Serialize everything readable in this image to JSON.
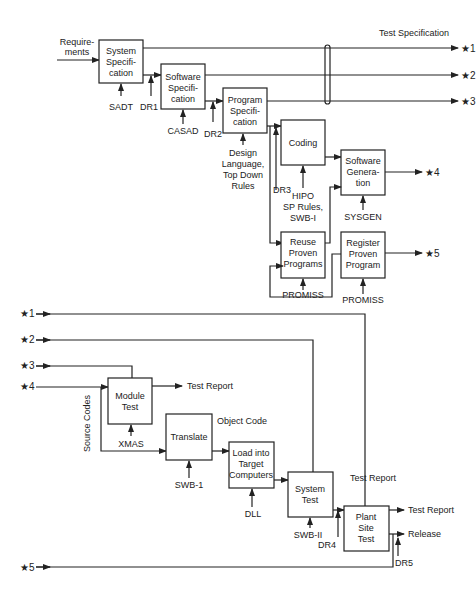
{
  "diagram": {
    "top_label": "Test Specification",
    "input_label": [
      "Require-",
      "ments"
    ],
    "boxes": {
      "system_spec": [
        "System",
        "Specifi-",
        "cation"
      ],
      "software_spec": [
        "Software",
        "Specifi-",
        "cation"
      ],
      "program_spec": [
        "Program",
        "Specifi-",
        "cation"
      ],
      "coding": [
        "Coding"
      ],
      "software_generation": [
        "Software",
        "Genera-",
        "tion"
      ],
      "reuse_proven": [
        "Reuse",
        "Proven",
        "Programs"
      ],
      "register_proven": [
        "Register",
        "Proven",
        "Program"
      ],
      "module_test": [
        "Module",
        "Test"
      ],
      "translate": [
        "Translate"
      ],
      "load_target": [
        "Load into",
        "Target",
        "Computers"
      ],
      "system_test": [
        "System",
        "Test"
      ],
      "plant_site_test": [
        "Plant",
        "Site",
        "Test"
      ]
    },
    "tools": {
      "sadt": "SADT",
      "casad": "CASAD",
      "design_lang": [
        "Design",
        "Language,",
        "Top Down",
        "Rules"
      ],
      "hipo": [
        "HIPO",
        "SP Rules,",
        "SWB-I"
      ],
      "sysgen": "SYSGEN",
      "promiss_reuse": "PROMISS",
      "promiss_register": "PROMISS",
      "xmas": "XMAS",
      "swb1": "SWB-1",
      "dll": "DLL",
      "swb2": "SWB-II"
    },
    "reviews": {
      "dr1": "DR1",
      "dr2": "DR2",
      "dr3": "DR3",
      "dr4": "DR4",
      "dr5": "DR5"
    },
    "connectors": {
      "c1": "★1",
      "c2": "★2",
      "c3": "★3",
      "c4": "★4",
      "c5": "★5"
    },
    "outputs": {
      "test_report_module": "Test Report",
      "object_code": "Object Code",
      "test_report_system": "Test Report",
      "test_report_plant": "Test Report",
      "release": "Release",
      "source_codes": "Source Codes"
    }
  }
}
